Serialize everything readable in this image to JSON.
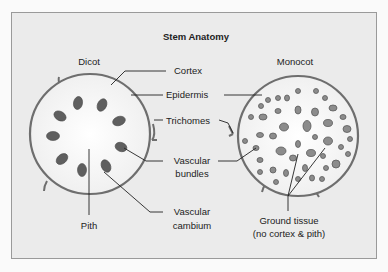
{
  "title": "Stem Anatomy",
  "dicot": {
    "label": "Dicot",
    "parts": {
      "pith": "Pith"
    }
  },
  "monocot": {
    "label": "Monocot",
    "ground_tissue": [
      "Ground tissue",
      "(no cortex & pith)"
    ]
  },
  "center_labels": {
    "cortex": "Cortex",
    "epidermis": "Epidermis",
    "trichomes": "Trichomes",
    "vascular_bundles": [
      "Vascular",
      "bundles"
    ],
    "vascular_cambium": [
      "Vascular",
      "cambium"
    ]
  },
  "colors": {
    "background": "#ebebeb",
    "circle_fill": "#fbfbfb",
    "outline": "#6e6e6e",
    "bundle": "#5f5f5f",
    "text": "#222222"
  }
}
